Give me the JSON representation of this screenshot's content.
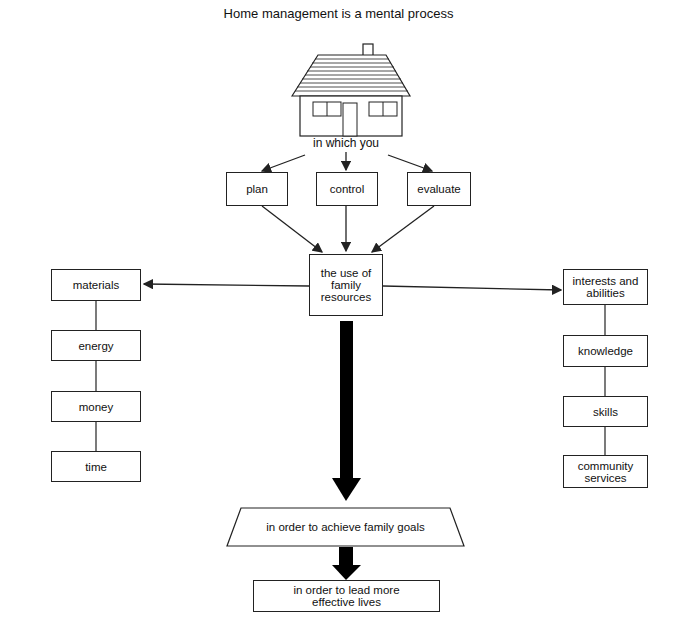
{
  "title": "Home management is a mental process",
  "house_caption": "in which you",
  "actions": [
    "plan",
    "control",
    "evaluate"
  ],
  "center": "the use of family resources",
  "left_resources": [
    "materials",
    "energy",
    "money",
    "time"
  ],
  "right_resources": [
    "interests and abilities",
    "knowledge",
    "skills",
    "community services"
  ],
  "goal": "in order to achieve family goals",
  "outcome": "in order to lead more effective lives",
  "colors": {
    "line": "#222222",
    "arrow_fill": "#000000",
    "background": "#ffffff"
  }
}
